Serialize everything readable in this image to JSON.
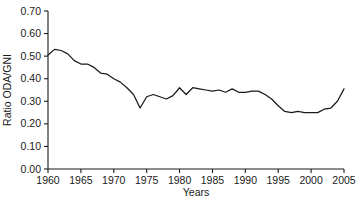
{
  "chart_data": {
    "type": "line",
    "title": "",
    "xlabel": "Years",
    "ylabel": "Ratio ODA/GNI",
    "xlim": [
      1960,
      2005
    ],
    "ylim": [
      0.0,
      0.7
    ],
    "grid": false,
    "legend": "none",
    "line_color": "#1a1a1a",
    "xticks": [
      1960,
      1965,
      1970,
      1975,
      1980,
      1985,
      1990,
      1995,
      2000,
      2005
    ],
    "xtick_labels": [
      "1960",
      "1965",
      "1970",
      "1975",
      "1980",
      "1985",
      "1990",
      "1995",
      "2000",
      "2005"
    ],
    "yticks": [
      0.0,
      0.1,
      0.2,
      0.3,
      0.4,
      0.5,
      0.6,
      0.7
    ],
    "ytick_labels": [
      "0.00",
      "0.10",
      "0.20",
      "0.30",
      "0.40",
      "0.50",
      "0.60",
      "0.70"
    ],
    "series": [
      {
        "name": "Ratio ODA/GNI",
        "x": [
          1960,
          1961,
          1962,
          1963,
          1964,
          1965,
          1966,
          1967,
          1968,
          1969,
          1970,
          1971,
          1972,
          1973,
          1974,
          1975,
          1976,
          1977,
          1978,
          1979,
          1980,
          1981,
          1982,
          1983,
          1984,
          1985,
          1986,
          1987,
          1988,
          1989,
          1990,
          1991,
          1992,
          1993,
          1994,
          1995,
          1996,
          1997,
          1998,
          1999,
          2000,
          2001,
          2002,
          2003,
          2004,
          2005
        ],
        "values": [
          0.505,
          0.53,
          0.525,
          0.51,
          0.48,
          0.465,
          0.465,
          0.45,
          0.425,
          0.42,
          0.4,
          0.385,
          0.36,
          0.33,
          0.27,
          0.32,
          0.33,
          0.32,
          0.31,
          0.325,
          0.36,
          0.33,
          0.36,
          0.355,
          0.35,
          0.345,
          0.35,
          0.34,
          0.355,
          0.34,
          0.34,
          0.345,
          0.345,
          0.33,
          0.31,
          0.28,
          0.255,
          0.25,
          0.255,
          0.25,
          0.25,
          0.25,
          0.265,
          0.27,
          0.3,
          0.355
        ]
      }
    ]
  }
}
